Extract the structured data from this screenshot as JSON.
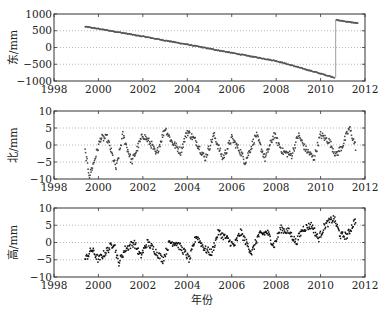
{
  "chart_data": [
    {
      "type": "scatter",
      "title": "",
      "xlabel": "",
      "ylabel": "东/mm",
      "xlim": [
        1998,
        2012
      ],
      "ylim": [
        -1000,
        1000
      ],
      "xticks": [
        1998,
        2000,
        2002,
        2004,
        2006,
        2008,
        2010,
        2012
      ],
      "yticks": [
        1000,
        500,
        0,
        -500,
        -1000
      ],
      "grid": "horizontal dotted at 500, 0, -500",
      "series": [
        {
          "name": "East",
          "segments": [
            {
              "x": [
                1999.4,
                2000.0,
                2002.0,
                2004.0,
                2006.0,
                2008.0,
                2010.0,
                2010.65
              ],
              "y": [
                620,
                560,
                330,
                90,
                -160,
                -400,
                -780,
                -900
              ]
            },
            {
              "x": [
                2010.7,
                2011.0,
                2011.5,
                2011.7
              ],
              "y": [
                820,
                790,
                740,
                720
              ]
            }
          ]
        }
      ]
    },
    {
      "type": "scatter",
      "title": "",
      "xlabel": "",
      "ylabel": "北/mm",
      "xlim": [
        1998,
        2012
      ],
      "ylim": [
        -10,
        10
      ],
      "xticks": [
        1998,
        2000,
        2002,
        2004,
        2006,
        2008,
        2010,
        2012
      ],
      "yticks": [
        10,
        5,
        0,
        -5,
        -10
      ],
      "grid": "horizontal dotted at 5, 0, -5",
      "series": [
        {
          "name": "North",
          "x": [
            1999.4,
            1999.6,
            1999.8,
            2000.1,
            2000.4,
            2000.8,
            2001.1,
            2001.5,
            2002.0,
            2002.4,
            2002.6,
            2003.0,
            2003.3,
            2003.7,
            2004.0,
            2004.4,
            2004.8,
            2005.2,
            2005.6,
            2006.0,
            2006.4,
            2006.6,
            2007.1,
            2007.5,
            2007.9,
            2008.3,
            2008.7,
            2009.0,
            2009.3,
            2009.7,
            2010.0,
            2010.4,
            2010.7,
            2011.0,
            2011.3,
            2011.6
          ],
          "y": [
            -2,
            -9,
            -5,
            2,
            2,
            -7,
            3,
            -5,
            3,
            0,
            -3,
            5,
            1,
            -2,
            4,
            1,
            -4,
            3,
            -4,
            2,
            -2,
            -5,
            3,
            -4,
            3,
            -2,
            -3,
            3,
            -1,
            -4,
            3,
            1,
            -3,
            0,
            5,
            -1
          ]
        }
      ]
    },
    {
      "type": "scatter",
      "title": "",
      "xlabel": "年份",
      "ylabel": "高/mm",
      "xlim": [
        1998,
        2012
      ],
      "ylim": [
        -10,
        10
      ],
      "xticks": [
        1998,
        2000,
        2002,
        2004,
        2006,
        2008,
        2010,
        2012
      ],
      "yticks": [
        10,
        5,
        0,
        -5,
        -10
      ],
      "grid": "horizontal dotted at 5, 0, -5",
      "series": [
        {
          "name": "Up",
          "x": [
            1999.4,
            1999.7,
            2000.0,
            2000.3,
            2000.7,
            2000.9,
            2001.2,
            2001.6,
            2001.9,
            2002.2,
            2002.5,
            2002.9,
            2003.2,
            2003.5,
            2003.9,
            2004.1,
            2004.4,
            2004.8,
            2005.1,
            2005.4,
            2005.8,
            2006.1,
            2006.4,
            2006.9,
            2007.2,
            2007.6,
            2007.9,
            2008.2,
            2008.6,
            2008.9,
            2009.2,
            2009.6,
            2009.9,
            2010.2,
            2010.6,
            2010.9,
            2011.2,
            2011.6
          ],
          "y": [
            -5,
            -2,
            -5,
            -3,
            0,
            -6,
            -2,
            0,
            -4,
            0,
            -2,
            -5,
            0,
            0,
            -3,
            -5,
            2,
            -2,
            -3,
            3,
            1,
            -1,
            3,
            -3,
            2,
            3,
            -1,
            4,
            3,
            0,
            4,
            5,
            1,
            5,
            7,
            2,
            2,
            7
          ]
        }
      ]
    }
  ]
}
